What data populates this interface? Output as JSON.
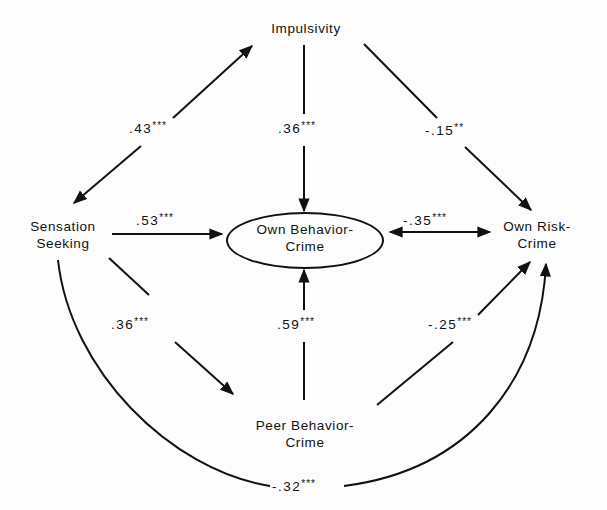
{
  "diagram": {
    "type": "path-model",
    "nodes": {
      "impulsivity": {
        "label": "Impulsivity"
      },
      "sensation_seeking": {
        "line1": "Sensation",
        "line2": "Seeking"
      },
      "own_behavior_crime": {
        "line1": "Own Behavior-",
        "line2": "Crime",
        "shape": "ellipse"
      },
      "own_risk_crime": {
        "line1": "Own Risk-",
        "line2": "Crime"
      },
      "peer_behavior_crime": {
        "line1": "Peer Behavior-",
        "line2": "Crime"
      }
    },
    "edges": {
      "impulsivity_sensation": {
        "from": "Impulsivity",
        "to": "Sensation Seeking",
        "value": ".43",
        "stars": "***",
        "direction": "bidirectional"
      },
      "impulsivity_ownbehavior": {
        "from": "Impulsivity",
        "to": "Own Behavior-Crime",
        "value": ".36",
        "stars": "***",
        "direction": "forward"
      },
      "impulsivity_ownrisk": {
        "from": "Impulsivity",
        "to": "Own Risk-Crime",
        "value": "-.15",
        "stars": "**",
        "direction": "forward"
      },
      "sensation_ownbehavior": {
        "from": "Sensation Seeking",
        "to": "Own Behavior-Crime",
        "value": ".53",
        "stars": "***",
        "direction": "forward"
      },
      "ownbehavior_ownrisk": {
        "from": "Own Behavior-Crime",
        "to": "Own Risk-Crime",
        "value": "-.35",
        "stars": "***",
        "direction": "bidirectional"
      },
      "sensation_peer": {
        "from": "Sensation Seeking",
        "to": "Peer Behavior-Crime",
        "value": ".36",
        "stars": "***",
        "direction": "forward"
      },
      "peer_ownbehavior": {
        "from": "Peer Behavior-Crime",
        "to": "Own Behavior-Crime",
        "value": ".59",
        "stars": "***",
        "direction": "forward"
      },
      "peer_ownrisk": {
        "from": "Peer Behavior-Crime",
        "to": "Own Risk-Crime",
        "value": "-.25",
        "stars": "***",
        "direction": "forward"
      },
      "sensation_ownrisk": {
        "from": "Sensation Seeking",
        "to": "Own Risk-Crime",
        "value": "-.32",
        "stars": "***",
        "direction": "forward",
        "curved": true
      }
    }
  }
}
